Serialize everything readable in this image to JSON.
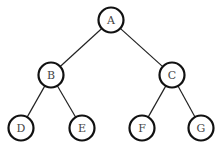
{
  "diagram": {
    "type": "binary-tree",
    "nodes": [
      {
        "id": "A",
        "label": "A",
        "x": 111,
        "y": 20
      },
      {
        "id": "B",
        "label": "B",
        "x": 51,
        "y": 75
      },
      {
        "id": "C",
        "label": "C",
        "x": 172,
        "y": 75
      },
      {
        "id": "D",
        "label": "D",
        "x": 21,
        "y": 128
      },
      {
        "id": "E",
        "label": "E",
        "x": 82,
        "y": 128
      },
      {
        "id": "F",
        "label": "F",
        "x": 142,
        "y": 128
      },
      {
        "id": "G",
        "label": "G",
        "x": 201,
        "y": 128
      }
    ],
    "edges": [
      {
        "from": "A",
        "to": "B"
      },
      {
        "from": "A",
        "to": "C"
      },
      {
        "from": "B",
        "to": "D"
      },
      {
        "from": "B",
        "to": "E"
      },
      {
        "from": "C",
        "to": "F"
      },
      {
        "from": "C",
        "to": "G"
      }
    ],
    "node_radius": 12.5
  }
}
